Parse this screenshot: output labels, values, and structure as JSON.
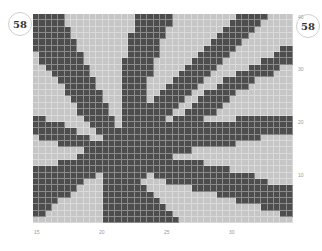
{
  "page": {
    "badge_left": "58",
    "badge_right": "58"
  },
  "chart_data": {
    "type": "heatmap",
    "title": "58",
    "columns": 41,
    "rows": 33,
    "colors": {
      "on": "#4d4d4d",
      "off": "#c6c6c6"
    },
    "row_labels": [
      {
        "label": "40",
        "row_from_bottom": 40
      },
      {
        "label": "30",
        "row_from_bottom": 30
      },
      {
        "label": "20",
        "row_from_bottom": 20
      },
      {
        "label": "10",
        "row_from_bottom": 10
      }
    ],
    "col_labels": [
      {
        "label": "15",
        "col": 0
      },
      {
        "label": "20",
        "col": 10
      },
      {
        "label": "25",
        "col": 20
      },
      {
        "label": "30",
        "col": 30
      }
    ],
    "grid": [
      "11111000000000001111110000000000111110000",
      "11111000000000001111110000000001111100000",
      "11111100000000001111100000000011111000000",
      "11111100000000011111100000000111110000000",
      "11111110000000011111000000001111100000000",
      "11111110000000011111000000011111000000011",
      "01111111000000011111000000111110000000111",
      "01111111000000111110000001111100000011111",
      "00111111100000111110000011111000001111100",
      "00011111100000111110000111110000111111000",
      "00001111110000111100001111100011111000000",
      "00000111110000111100011111000111110000000",
      "00000111111000111100111110011111000000000",
      "00000011111000111101111100111110000000000",
      "00000001111100111111111001111100000000000",
      "00000001111100111111110011111000000000000",
      "11000000111110111111101111100000111111111",
      "11111000011110111111111111111111111111111",
      "11111110001111111111111111111111111111111",
      "01111111100111111111111111111111111100000",
      "00001111111111111111111111111111000000000",
      "00000000111111111111111110000000000000000",
      "00000001111111111111110000000000000000000",
      "00001111111111111111111111100000000000000",
      "11111111111111111111111111111110000000000",
      "11111111110111111101111111111111111000000",
      "11111111000111111000011111111111111110000",
      "11111110000111111100000001111111111111111",
      "11111100000111111110000000000111111111111",
      "11110000000111111111000000000000111111111",
      "11100000000111111111100000000000000011111",
      "11000000000111111111110000000000000000011",
      "00000000000111111111111000000000000000000"
    ]
  }
}
